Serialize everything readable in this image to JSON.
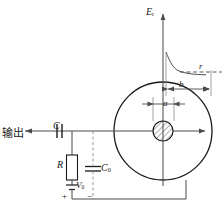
{
  "figure": {
    "type": "schematic-diagram",
    "colors": {
      "line": "#1a1a1a",
      "thin_line": "#5a5a5a",
      "background": "#ffffff",
      "hatch": "#4a4a4a"
    },
    "labels": {
      "field_axis": "E",
      "field_axis_sub": "r",
      "outer_radius": "r",
      "cathode_distance": "b",
      "anode_diameter": "a",
      "coupling_capacitor": "C",
      "load_resistor": "R",
      "bias_supply": "V",
      "bias_supply_sub": "0",
      "filter_capacitor": "C",
      "filter_capacitor_sub": "0",
      "output": "输出",
      "polarity_positive": "+",
      "polarity_negative": "−"
    },
    "elements": [
      {
        "name": "detector-outer-circle",
        "kind": "circle",
        "cx": 163,
        "cy": 131,
        "r": 49
      },
      {
        "name": "anode-wire",
        "kind": "hatched-circle",
        "cx": 163,
        "cy": 131,
        "r": 10
      },
      {
        "name": "field-axis",
        "kind": "arrow-vertical",
        "x": 163,
        "y1": 184,
        "y2": 10
      },
      {
        "name": "field-decay-curve",
        "kind": "curve"
      },
      {
        "name": "radius-level-dashed",
        "kind": "dashed-horizontal",
        "y": 72
      },
      {
        "name": "dimension-b",
        "kind": "double-arrow",
        "y": 89
      },
      {
        "name": "dimension-a",
        "kind": "double-arrow",
        "y": 104
      },
      {
        "name": "radial-arrow",
        "kind": "arrow-horizontal",
        "y": 131
      },
      {
        "name": "signal-line",
        "kind": "wire",
        "y": 131
      },
      {
        "name": "coupling-capacitor",
        "kind": "capacitor",
        "x": 61,
        "y": 131
      },
      {
        "name": "load-resistor",
        "kind": "resistor",
        "x": 72,
        "y": 171
      },
      {
        "name": "bias-battery",
        "kind": "battery",
        "x": 72,
        "y": 190
      },
      {
        "name": "filter-capacitor",
        "kind": "capacitor-vertical",
        "x": 93,
        "y": 171
      },
      {
        "name": "ground-return",
        "kind": "wire"
      }
    ]
  }
}
